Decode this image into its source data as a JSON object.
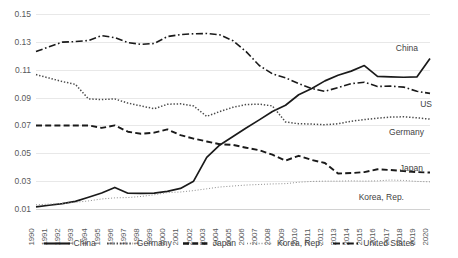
{
  "chart_data": {
    "type": "line",
    "title": "",
    "subtitle": "",
    "xlabel": "",
    "ylabel": "",
    "grid": true,
    "legend_position": "bottom",
    "xlim": [
      1990,
      2020
    ],
    "ylim": [
      0.01,
      0.15
    ],
    "ytick_labels": [
      "0.15",
      "0.13",
      "0.11",
      "0.09",
      "0.07",
      "0.05",
      "0.03",
      "0.01"
    ],
    "ytick_values": [
      0.15,
      0.13,
      0.11,
      0.09,
      0.07,
      0.05,
      0.03,
      0.01
    ],
    "x": [
      1990,
      1991,
      1992,
      1993,
      1994,
      1995,
      1996,
      1997,
      1998,
      1999,
      2000,
      2001,
      2002,
      2003,
      2004,
      2005,
      2006,
      2007,
      2008,
      2009,
      2010,
      2011,
      2012,
      2013,
      2014,
      2015,
      2016,
      2017,
      2018,
      2019,
      2020
    ],
    "xtick_labels": [
      "1990",
      "1991",
      "1992",
      "1993",
      "1994",
      "1995",
      "1996",
      "1997",
      "1998",
      "1999",
      "2000",
      "2001",
      "2002",
      "2003",
      "2004",
      "2005",
      "2006",
      "2007",
      "2008",
      "2009",
      "2010",
      "2011",
      "2012",
      "2013",
      "2014",
      "2015",
      "2016",
      "2017",
      "2018",
      "2019",
      "2020"
    ],
    "series": [
      {
        "name": "China",
        "style": "solid",
        "color": "#1a1a1a",
        "end_label": "China",
        "values": [
          0.0115,
          0.0127,
          0.0139,
          0.0155,
          0.0184,
          0.0215,
          0.0255,
          0.0213,
          0.0212,
          0.0214,
          0.0227,
          0.0248,
          0.03,
          0.047,
          0.056,
          0.062,
          0.0682,
          0.074,
          0.08,
          0.0845,
          0.092,
          0.0965,
          0.102,
          0.106,
          0.109,
          0.113,
          0.1052,
          0.1048,
          0.1046,
          0.1048,
          0.118
        ]
      },
      {
        "name": "Germany",
        "style": "dotted",
        "color": "#4a4a4a",
        "end_label": "Germany",
        "values": [
          0.1065,
          0.104,
          0.1015,
          0.0995,
          0.089,
          0.0886,
          0.089,
          0.086,
          0.084,
          0.082,
          0.0852,
          0.0855,
          0.084,
          0.0765,
          0.08,
          0.083,
          0.085,
          0.0853,
          0.084,
          0.0725,
          0.0712,
          0.071,
          0.0705,
          0.0712,
          0.073,
          0.0742,
          0.0752,
          0.076,
          0.0762,
          0.0755,
          0.0745
        ]
      },
      {
        "name": "Japan",
        "style": "dashed",
        "color": "#1a1a1a",
        "end_label": "Japan",
        "values": [
          0.07,
          0.07,
          0.07,
          0.07,
          0.07,
          0.0682,
          0.07,
          0.0655,
          0.064,
          0.0648,
          0.0672,
          0.063,
          0.0605,
          0.0585,
          0.0565,
          0.056,
          0.054,
          0.0522,
          0.049,
          0.0448,
          0.0482,
          0.0452,
          0.043,
          0.0355,
          0.0358,
          0.0365,
          0.0385,
          0.038,
          0.0372,
          0.0365,
          0.0362
        ]
      },
      {
        "name": "Korea, Rep.",
        "style": "fine-dotted",
        "color": "#8d8d8d",
        "end_label": "Korea, Rep.",
        "values": [
          0.013,
          0.0135,
          0.014,
          0.0148,
          0.0158,
          0.0172,
          0.018,
          0.0182,
          0.019,
          0.0202,
          0.0218,
          0.0222,
          0.0232,
          0.0245,
          0.0258,
          0.0265,
          0.0272,
          0.0276,
          0.028,
          0.0282,
          0.0292,
          0.0298,
          0.03,
          0.03,
          0.0302,
          0.03,
          0.0302,
          0.0308,
          0.0305,
          0.0298,
          0.0295
        ]
      },
      {
        "name": "United States",
        "style": "dash-dot",
        "color": "#1a1a1a",
        "end_label": "US",
        "values": [
          0.123,
          0.1265,
          0.1298,
          0.1302,
          0.131,
          0.1345,
          0.133,
          0.1295,
          0.1282,
          0.1288,
          0.1338,
          0.1352,
          0.1358,
          0.136,
          0.135,
          0.1308,
          0.123,
          0.113,
          0.107,
          0.1042,
          0.1,
          0.0965,
          0.0945,
          0.0972,
          0.1,
          0.101,
          0.098,
          0.0982,
          0.0975,
          0.0945,
          0.093
        ]
      }
    ]
  },
  "legend": {
    "items": [
      {
        "label": "China",
        "style": "solid"
      },
      {
        "label": "Germany",
        "style": "dotted"
      },
      {
        "label": "Japan",
        "style": "dashed"
      },
      {
        "label": "Korea, Rep.",
        "style": "fine-dotted"
      },
      {
        "label": "United States",
        "style": "dash-dot"
      }
    ]
  },
  "end_labels": [
    {
      "name": "China",
      "text": "China"
    },
    {
      "name": "US",
      "text": "US"
    },
    {
      "name": "Germany",
      "text": "Germany"
    },
    {
      "name": "Japan",
      "text": "Japan"
    },
    {
      "name": "Korea, Rep.",
      "text": "Korea, Rep."
    }
  ]
}
